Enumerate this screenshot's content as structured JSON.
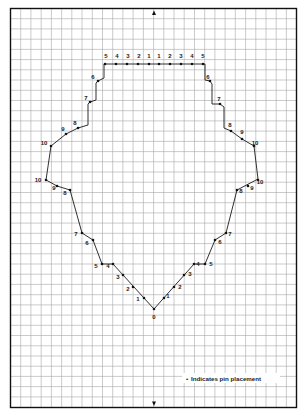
{
  "diagram": {
    "type": "pin-placement-grid",
    "grid": {
      "cell_px": 10,
      "line_color": "#a8a8a8",
      "border_color": "#111111"
    },
    "arrows": {
      "top": "arrow-up",
      "bottom": "arrow-down"
    },
    "legend": {
      "bullet": "•",
      "text": "Indicates pin placement"
    },
    "outline_color": "#1a1a1a",
    "pins": [
      {
        "label": "5",
        "x": 105,
        "y": 64,
        "lx": 106,
        "ly": 58
      },
      {
        "label": "4",
        "x": 116,
        "y": 64,
        "lx": 117,
        "ly": 58
      },
      {
        "label": "3",
        "x": 127,
        "y": 64,
        "lx": 128,
        "ly": 58
      },
      {
        "label": "2",
        "x": 138,
        "y": 64,
        "lx": 139,
        "ly": 58
      },
      {
        "label": "1",
        "x": 149,
        "y": 64,
        "lx": 149,
        "ly": 58
      },
      {
        "label": "1",
        "x": 159,
        "y": 64,
        "lx": 159,
        "ly": 58
      },
      {
        "label": "2",
        "x": 170,
        "y": 64,
        "lx": 170,
        "ly": 58
      },
      {
        "label": "3",
        "x": 181,
        "y": 64,
        "lx": 181,
        "ly": 58
      },
      {
        "label": "4",
        "x": 192,
        "y": 64,
        "lx": 192,
        "ly": 58
      },
      {
        "label": "5",
        "x": 203,
        "y": 64,
        "lx": 203,
        "ly": 58
      },
      {
        "label": "6",
        "x": 98,
        "y": 81,
        "lx": 93,
        "ly": 79
      },
      {
        "label": "7",
        "x": 90,
        "y": 102,
        "lx": 86,
        "ly": 100
      },
      {
        "label": "8",
        "x": 78,
        "y": 128,
        "lx": 75,
        "ly": 125
      },
      {
        "label": "9",
        "x": 66,
        "y": 134,
        "lx": 63,
        "ly": 131
      },
      {
        "label": "10",
        "x": 51,
        "y": 146,
        "lx": 44,
        "ly": 145
      },
      {
        "label": "10",
        "x": 46,
        "y": 180,
        "lx": 38,
        "ly": 182
      },
      {
        "label": "9",
        "x": 57,
        "y": 186,
        "lx": 54,
        "ly": 190
      },
      {
        "label": "8",
        "x": 70,
        "y": 190,
        "lx": 65,
        "ly": 195
      },
      {
        "label": "7",
        "x": 82,
        "y": 233,
        "lx": 76,
        "ly": 236
      },
      {
        "label": "6",
        "x": 93,
        "y": 240,
        "lx": 87,
        "ly": 245
      },
      {
        "label": "5",
        "x": 102,
        "y": 264,
        "lx": 96,
        "ly": 268
      },
      {
        "label": "4",
        "x": 113,
        "y": 264,
        "lx": 108,
        "ly": 268
      },
      {
        "label": "3",
        "x": 123,
        "y": 275,
        "lx": 118,
        "ly": 279
      },
      {
        "label": "2",
        "x": 133,
        "y": 287,
        "lx": 128,
        "ly": 291
      },
      {
        "label": "1",
        "x": 144,
        "y": 298,
        "lx": 138,
        "ly": 301
      },
      {
        "label": "0",
        "x": 154,
        "y": 309,
        "lx": 154,
        "ly": 319
      },
      {
        "label": "1",
        "x": 164,
        "y": 298,
        "lx": 168,
        "ly": 298
      },
      {
        "label": "2",
        "x": 174,
        "y": 287,
        "lx": 180,
        "ly": 289
      },
      {
        "label": "3",
        "x": 184,
        "y": 275,
        "lx": 190,
        "ly": 276
      },
      {
        "label": "4",
        "x": 194,
        "y": 264,
        "lx": 198,
        "ly": 266
      },
      {
        "label": "5",
        "x": 205,
        "y": 264,
        "lx": 211,
        "ly": 266
      },
      {
        "label": "6",
        "x": 215,
        "y": 240,
        "lx": 220,
        "ly": 244
      },
      {
        "label": "7",
        "x": 226,
        "y": 233,
        "lx": 230,
        "ly": 236
      },
      {
        "label": "8",
        "x": 237,
        "y": 190,
        "lx": 241,
        "ly": 193
      },
      {
        "label": "9",
        "x": 248,
        "y": 186,
        "lx": 252,
        "ly": 190
      },
      {
        "label": "10",
        "x": 258,
        "y": 180,
        "lx": 260,
        "ly": 184
      },
      {
        "label": "10",
        "x": 254,
        "y": 146,
        "lx": 255,
        "ly": 145
      },
      {
        "label": "9",
        "x": 242,
        "y": 139,
        "lx": 242,
        "ly": 134
      },
      {
        "label": "8",
        "x": 231,
        "y": 131,
        "lx": 230,
        "ly": 127
      },
      {
        "label": "7",
        "x": 220,
        "y": 104,
        "lx": 219,
        "ly": 101
      },
      {
        "label": "6",
        "x": 210,
        "y": 81,
        "lx": 208,
        "ly": 79
      }
    ],
    "outline": [
      [
        104,
        64
      ],
      [
        205,
        64
      ],
      [
        205,
        80
      ],
      [
        210,
        81
      ],
      [
        212,
        84
      ],
      [
        212,
        104
      ],
      [
        220,
        104
      ],
      [
        224,
        107
      ],
      [
        224,
        128
      ],
      [
        231,
        131
      ],
      [
        242,
        139
      ],
      [
        254,
        146
      ],
      [
        258,
        179
      ],
      [
        237,
        190
      ],
      [
        226,
        233
      ],
      [
        215,
        240
      ],
      [
        205,
        264
      ],
      [
        194,
        264
      ],
      [
        154,
        309
      ],
      [
        113,
        264
      ],
      [
        102,
        264
      ],
      [
        93,
        240
      ],
      [
        82,
        233
      ],
      [
        70,
        190
      ],
      [
        57,
        186
      ],
      [
        46,
        180
      ],
      [
        51,
        146
      ],
      [
        66,
        134
      ],
      [
        78,
        128
      ],
      [
        88,
        125
      ],
      [
        88,
        104
      ],
      [
        90,
        102
      ],
      [
        96,
        100
      ],
      [
        96,
        83
      ],
      [
        98,
        81
      ],
      [
        104,
        78
      ],
      [
        104,
        64
      ]
    ]
  }
}
